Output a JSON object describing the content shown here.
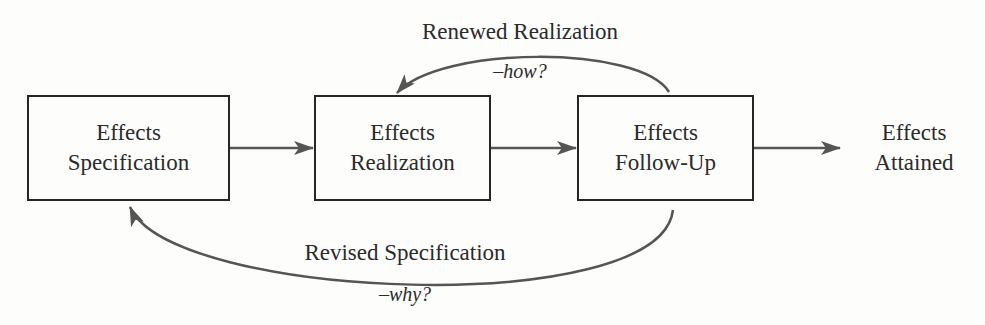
{
  "colors": {
    "box_border": "#262626",
    "arrow": "#555555",
    "text": "#2b2b2b",
    "background": "#fdfdfc"
  },
  "nodes": [
    {
      "id": "specification",
      "lines": [
        "Effects",
        "Specification"
      ]
    },
    {
      "id": "realization",
      "lines": [
        "Effects",
        "Realization"
      ]
    },
    {
      "id": "follow_up",
      "lines": [
        "Effects",
        "Follow-Up"
      ]
    }
  ],
  "terminal": {
    "lines": [
      "Effects",
      "Attained"
    ]
  },
  "feedback": {
    "renewed": {
      "title": "Renewed Realization",
      "question": "–how?",
      "from": "follow_up",
      "to": "realization"
    },
    "revised": {
      "title": "Revised Specification",
      "question": "–why?",
      "from": "follow_up",
      "to": "specification"
    }
  },
  "edges": [
    {
      "from": "specification",
      "to": "realization"
    },
    {
      "from": "realization",
      "to": "follow_up"
    },
    {
      "from": "follow_up",
      "to": "terminal"
    }
  ]
}
